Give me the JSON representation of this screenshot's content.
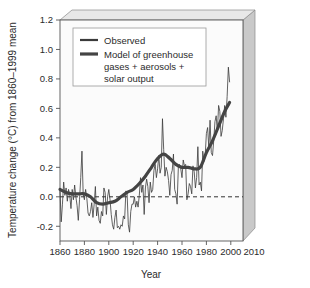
{
  "chart_data": {
    "type": "line",
    "title": "",
    "xlabel": "Year",
    "ylabel": "Temperature change (°C) from 1860–1999 mean",
    "xlim": [
      1860,
      2010
    ],
    "ylim": [
      -0.3,
      1.2
    ],
    "xticks": [
      1860,
      1880,
      1900,
      1920,
      1940,
      1960,
      1980,
      2000,
      2010
    ],
    "xtick_labels": [
      "1860",
      "1880",
      "1900",
      "1920",
      "1940",
      "1960",
      "1980",
      "2000",
      "2010"
    ],
    "yticks": [
      -0.2,
      0.0,
      0.2,
      0.4,
      0.6,
      0.8,
      1.0,
      1.2
    ],
    "ytick_labels": [
      "-0.2",
      "0.0",
      "0.2",
      "0.4",
      "0.6",
      "0.8",
      "1.0",
      "1.2"
    ],
    "grid": false,
    "legend_position": "upper-left",
    "zero_reference_line": 0.0,
    "colors": {
      "observed": "#3a3a3a",
      "model": "#444444",
      "axis": "#555555",
      "plot_background": "#fbfbfb",
      "box_side": "#c9c9c9",
      "box_top": "#e3e3e3",
      "zero_line": "#333333"
    },
    "series": [
      {
        "name": "Observed",
        "style": "thin",
        "x": [
          1860,
          1861,
          1862,
          1863,
          1864,
          1865,
          1866,
          1867,
          1868,
          1869,
          1870,
          1871,
          1872,
          1873,
          1874,
          1875,
          1876,
          1877,
          1878,
          1879,
          1880,
          1881,
          1882,
          1883,
          1884,
          1885,
          1886,
          1887,
          1888,
          1889,
          1890,
          1891,
          1892,
          1893,
          1894,
          1895,
          1896,
          1897,
          1898,
          1899,
          1900,
          1901,
          1902,
          1903,
          1904,
          1905,
          1906,
          1907,
          1908,
          1909,
          1910,
          1911,
          1912,
          1913,
          1914,
          1915,
          1916,
          1917,
          1918,
          1919,
          1920,
          1921,
          1922,
          1923,
          1924,
          1925,
          1926,
          1927,
          1928,
          1929,
          1930,
          1931,
          1932,
          1933,
          1934,
          1935,
          1936,
          1937,
          1938,
          1939,
          1940,
          1941,
          1942,
          1943,
          1944,
          1945,
          1946,
          1947,
          1948,
          1949,
          1950,
          1951,
          1952,
          1953,
          1954,
          1955,
          1956,
          1957,
          1958,
          1959,
          1960,
          1961,
          1962,
          1963,
          1964,
          1965,
          1966,
          1967,
          1968,
          1969,
          1970,
          1971,
          1972,
          1973,
          1974,
          1975,
          1976,
          1977,
          1978,
          1979,
          1980,
          1981,
          1982,
          1983,
          1984,
          1985,
          1986,
          1987,
          1988,
          1989,
          1990,
          1991,
          1992,
          1993,
          1994,
          1995,
          1996,
          1997,
          1998,
          1999
        ],
        "y": [
          0.04,
          -0.17,
          -0.05,
          0.1,
          0.01,
          0.06,
          -0.03,
          0.05,
          0.01,
          -0.08,
          0.05,
          -0.02,
          0.08,
          0.0,
          -0.06,
          -0.16,
          -0.02,
          0.13,
          0.31,
          0.02,
          -0.02,
          0.05,
          -0.01,
          -0.11,
          -0.13,
          -0.1,
          -0.04,
          -0.14,
          -0.05,
          0.07,
          -0.13,
          -0.07,
          -0.16,
          -0.18,
          -0.1,
          -0.13,
          0.06,
          0.03,
          -0.12,
          0.0,
          0.05,
          -0.02,
          -0.12,
          -0.19,
          -0.22,
          -0.14,
          -0.09,
          -0.21,
          -0.2,
          -0.22,
          -0.19,
          -0.2,
          -0.13,
          -0.15,
          0.04,
          0.02,
          -0.19,
          -0.24,
          -0.1,
          -0.05,
          -0.05,
          0.0,
          -0.07,
          -0.03,
          -0.07,
          0.01,
          0.13,
          0.03,
          0.08,
          -0.12,
          0.06,
          0.12,
          0.07,
          -0.04,
          0.1,
          0.03,
          0.05,
          0.18,
          0.22,
          0.13,
          0.19,
          0.28,
          0.16,
          0.2,
          0.53,
          0.32,
          0.14,
          0.2,
          0.17,
          0.11,
          0.01,
          0.15,
          0.18,
          0.29,
          0.05,
          0.02,
          -0.05,
          0.2,
          0.22,
          0.19,
          0.13,
          0.25,
          0.21,
          0.22,
          -0.02,
          0.02,
          0.09,
          0.07,
          0.02,
          0.21,
          0.17,
          0.06,
          0.13,
          0.34,
          0.08,
          0.1,
          0.04,
          0.31,
          0.24,
          0.28,
          0.43,
          0.47,
          0.33,
          0.52,
          0.3,
          0.28,
          0.38,
          0.51,
          0.55,
          0.44,
          0.62,
          0.58,
          0.41,
          0.45,
          0.53,
          0.62,
          0.54,
          0.68,
          0.88,
          0.78
        ]
      },
      {
        "name": "Model of greenhouse gases + aerosols + solar output",
        "style": "thick",
        "x": [
          1860,
          1865,
          1870,
          1875,
          1880,
          1885,
          1890,
          1895,
          1900,
          1905,
          1910,
          1915,
          1920,
          1925,
          1930,
          1935,
          1940,
          1945,
          1950,
          1955,
          1960,
          1965,
          1970,
          1975,
          1980,
          1985,
          1990,
          1995,
          1999
        ],
        "y": [
          0.05,
          0.03,
          0.02,
          0.02,
          0.02,
          0.0,
          -0.04,
          -0.05,
          -0.04,
          -0.03,
          0.0,
          0.03,
          0.05,
          0.09,
          0.14,
          0.2,
          0.26,
          0.29,
          0.26,
          0.22,
          0.2,
          0.2,
          0.19,
          0.2,
          0.3,
          0.38,
          0.48,
          0.58,
          0.64
        ]
      }
    ],
    "legend": [
      {
        "label": "Observed",
        "style": "thin"
      },
      {
        "label": "Model of greenhouse",
        "style": "thick"
      },
      {
        "label": "gases + aerosols +",
        "style": "none"
      },
      {
        "label": "solar output",
        "style": "none"
      }
    ]
  }
}
